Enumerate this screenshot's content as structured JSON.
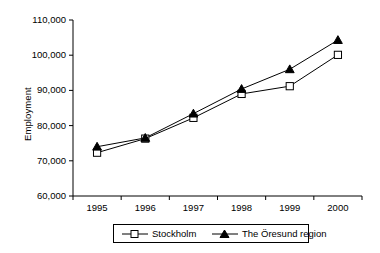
{
  "chart_data": {
    "type": "line",
    "title": "",
    "xlabel": "",
    "ylabel": "Employment",
    "categories": [
      "1995",
      "1996",
      "1997",
      "1998",
      "1999",
      "2000"
    ],
    "ylim": [
      60000,
      110000
    ],
    "ytick_labels": [
      "110,000",
      "100,000",
      "90,000",
      "80,000",
      "70,000",
      "60,000"
    ],
    "ytick_values": [
      110000,
      100000,
      90000,
      80000,
      70000,
      60000
    ],
    "grid": false,
    "legend_position": "bottom",
    "series": [
      {
        "name": "Stockholm",
        "marker": "open-square",
        "values": [
          72300,
          76300,
          82200,
          89000,
          91200,
          100100
        ]
      },
      {
        "name": "The Öresund region",
        "marker": "filled-triangle",
        "values": [
          74000,
          76500,
          83400,
          90400,
          96000,
          104300
        ]
      }
    ]
  },
  "colors": {
    "line": "#000000",
    "background": "#ffffff",
    "marker_fill_open": "#ffffff",
    "marker_fill_solid": "#000000"
  }
}
